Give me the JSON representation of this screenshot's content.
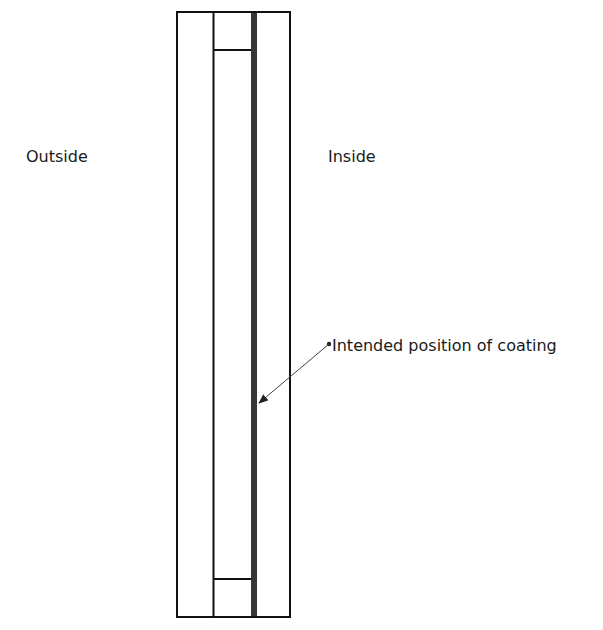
{
  "diagram": {
    "type": "cross-section",
    "labels": {
      "outside": "Outside",
      "inside": "Inside",
      "coating_callout": "Intended position of coating"
    },
    "colors": {
      "stroke": "#111111",
      "coating": "#3a3432",
      "arrow": "#333333",
      "background": "#ffffff"
    },
    "geometry": {
      "outer_box": {
        "x": 177,
        "y": 12,
        "width": 113,
        "height": 605
      },
      "left_pane_divider_x": 213,
      "coating_band": {
        "x": 251,
        "width": 6
      },
      "spacer_top_y": 50,
      "spacer_bottom_y": 579,
      "arrow": {
        "from": [
          328,
          344
        ],
        "to": [
          258,
          404
        ]
      }
    },
    "components": [
      {
        "name": "outer pane",
        "position": "left",
        "side": "Outside"
      },
      {
        "name": "cavity / spacer",
        "position": "middle"
      },
      {
        "name": "inner pane",
        "position": "right",
        "side": "Inside"
      },
      {
        "name": "coating",
        "position": "inner surface of cavity facing inner pane"
      }
    ]
  }
}
